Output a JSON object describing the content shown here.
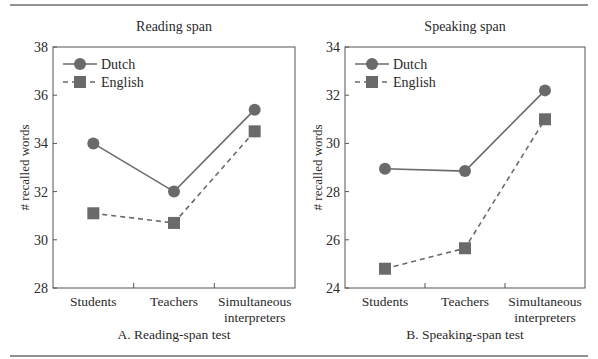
{
  "figure": {
    "rule_color": "#6e6e6e",
    "series_color": "#6a6a6a",
    "axis_color": "#555555"
  },
  "chart_data": [
    {
      "type": "line",
      "title": "Reading span",
      "caption": "A. Reading-span test",
      "xlabel": "",
      "ylabel": "# recalled words",
      "categories": [
        "Students",
        "Teachers",
        "Simultaneous interpreters"
      ],
      "category_lines": [
        [
          "Students"
        ],
        [
          "Teachers"
        ],
        [
          "Simultaneous",
          "interpreters"
        ]
      ],
      "ylim": [
        28,
        38
      ],
      "yticks": [
        28,
        30,
        32,
        34,
        36,
        38
      ],
      "grid": false,
      "legend_position": "top-left",
      "series": [
        {
          "name": "Dutch",
          "marker": "circle",
          "line": "solid",
          "values": [
            34.0,
            32.0,
            35.4
          ]
        },
        {
          "name": "English",
          "marker": "square",
          "line": "dashed",
          "values": [
            31.1,
            30.7,
            34.5
          ]
        }
      ]
    },
    {
      "type": "line",
      "title": "Speaking span",
      "caption": "B. Speaking-span test",
      "xlabel": "",
      "ylabel": "# recalled words",
      "categories": [
        "Students",
        "Teachers",
        "Simultaneous interpreters"
      ],
      "category_lines": [
        [
          "Students"
        ],
        [
          "Teachers"
        ],
        [
          "Simultaneous",
          "interpreters"
        ]
      ],
      "ylim": [
        24,
        34
      ],
      "yticks": [
        24,
        26,
        28,
        30,
        32,
        34
      ],
      "grid": false,
      "legend_position": "top-left",
      "series": [
        {
          "name": "Dutch",
          "marker": "circle",
          "line": "solid",
          "values": [
            28.95,
            28.85,
            32.2
          ]
        },
        {
          "name": "English",
          "marker": "square",
          "line": "dashed",
          "values": [
            24.8,
            25.65,
            31.0
          ]
        }
      ]
    }
  ]
}
